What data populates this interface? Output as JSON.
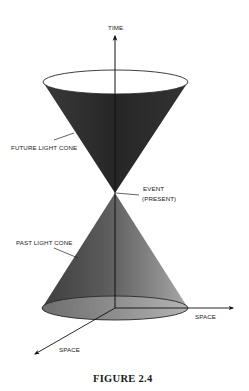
{
  "figure": {
    "caption": "FIGURE 2.4",
    "axes": {
      "time_label": "TIME",
      "space_right_label": "SPACE",
      "space_diagonal_label": "SPACE"
    },
    "labels": {
      "future_light_cone": "FUTURE LIGHT CONE",
      "past_light_cone": "PAST LIGHT CONE",
      "event_line1": "EVENT",
      "event_line2": "(PRESENT)"
    },
    "colors": {
      "future_cone_fill": "#2f2f2f",
      "future_cone_top": "#ffffff",
      "past_cone_dark": "#4a4a4a",
      "past_cone_light": "#9a9a9a",
      "past_cone_base": "#8c8c8c",
      "axis": "#111111"
    }
  }
}
